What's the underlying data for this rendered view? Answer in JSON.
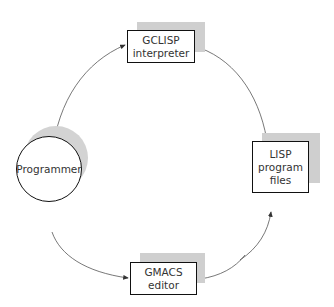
{
  "diagram": {
    "nodes": {
      "programmer": {
        "label": "Programmer",
        "shape": "circle"
      },
      "gclisp": {
        "line1": "GCLISP",
        "line2": "interpreter",
        "shape": "box"
      },
      "lisp_files": {
        "line1": "LISP",
        "line2": "program",
        "line3": "files",
        "shape": "box"
      },
      "gmacs": {
        "line1": "GMACS",
        "line2": "editor",
        "shape": "box"
      }
    },
    "edges": [
      {
        "from": "Programmer",
        "to": "GCLISP interpreter"
      },
      {
        "from": "LISP program files",
        "to": "GCLISP interpreter"
      },
      {
        "from": "Programmer",
        "to": "GMACS editor"
      },
      {
        "from": "GMACS editor",
        "to": "LISP program files"
      },
      {
        "from": "LISP program files",
        "to": "GMACS editor"
      }
    ],
    "colors": {
      "line": "#444444",
      "border": "#111111",
      "shadow": "#cfcfcf",
      "text": "#333333"
    }
  }
}
